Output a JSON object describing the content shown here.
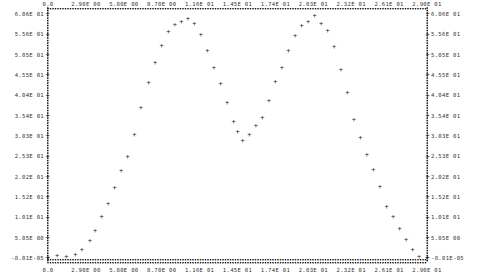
{
  "chart_data": {
    "type": "scatter",
    "title": "",
    "xlabel": "",
    "ylabel": "",
    "marker": "+",
    "frame_style": "dotted-asterisk border (line-printer style)",
    "grid": false,
    "legend": null,
    "xlim": [
      0.0,
      29.0
    ],
    "ylim": [
      -8.01e-05,
      60.6
    ],
    "x_ticks": [
      "0.0",
      "2.90E 00",
      "5.80E 00",
      "8.70E 00",
      "1.16E 01",
      "1.45E 01",
      "1.74E 01",
      "2.03E 01",
      "2.32E 01",
      "2.61E 01",
      "2.90E 01"
    ],
    "y_ticks": [
      "6.06E 01",
      "5.56E 01",
      "5.05E 01",
      "4.55E 01",
      "4.04E 01",
      "3.54E 01",
      "3.03E 01",
      "2.53E 01",
      "2.02E 01",
      "1.52E 01",
      "1.01E 01",
      "5.05E 00",
      "-8.01E-05"
    ],
    "series": [
      {
        "name": "data",
        "x": [
          0.0,
          0.7,
          1.4,
          2.1,
          2.6,
          3.2,
          3.6,
          4.1,
          4.6,
          5.1,
          5.6,
          6.1,
          6.6,
          7.1,
          7.7,
          8.2,
          8.7,
          9.2,
          9.7,
          10.2,
          10.7,
          11.2,
          11.7,
          12.2,
          12.7,
          13.2,
          13.7,
          14.2,
          14.5,
          14.9,
          15.4,
          15.9,
          16.4,
          16.9,
          17.4,
          17.9,
          18.4,
          18.9,
          19.4,
          19.9,
          20.4,
          20.9,
          21.4,
          21.9,
          22.4,
          22.9,
          23.4,
          23.9,
          24.4,
          24.9,
          25.4,
          25.9,
          26.4,
          26.9,
          27.4,
          27.9,
          28.4,
          29.0
        ],
        "y": [
          0.0,
          0.6,
          0.3,
          0.9,
          2.0,
          4.4,
          6.9,
          10.2,
          13.4,
          17.4,
          21.7,
          25.2,
          30.7,
          37.3,
          43.6,
          48.5,
          52.8,
          56.3,
          58.0,
          58.6,
          59.5,
          58.1,
          55.6,
          51.6,
          47.4,
          43.4,
          38.6,
          34.0,
          31.5,
          29.2,
          30.6,
          32.9,
          34.9,
          39.1,
          43.9,
          47.2,
          51.4,
          55.3,
          57.7,
          58.6,
          60.3,
          58.1,
          56.6,
          52.5,
          46.8,
          41.0,
          34.3,
          29.9,
          25.6,
          21.9,
          17.7,
          12.8,
          10.2,
          7.3,
          4.5,
          2.1,
          0.4,
          0.0
        ]
      }
    ]
  }
}
